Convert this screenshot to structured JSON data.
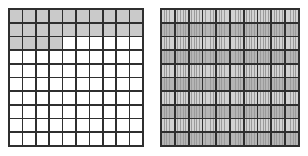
{
  "figure": {
    "background_color": "#ffffff",
    "line_color": "#2b2b2b",
    "shaded_color": "#c9c9c9",
    "strip_color": "#d2d2d2"
  },
  "grids": [
    {
      "name": "hundredths-grid",
      "label": "",
      "rows": 10,
      "columns": 10,
      "total_cells": 100,
      "shaded_cells": 24,
      "fraction_shaded": "24/100",
      "shading_by_row": [
        10,
        10,
        4,
        0,
        0,
        0,
        0,
        0,
        0,
        0
      ],
      "shaded_color": "#c9c9c9",
      "unshaded_color": "#ffffff"
    },
    {
      "name": "thousandths-grid",
      "label": "",
      "rows": 10,
      "columns": 10,
      "total_cells": 100,
      "strips_per_cell": 5,
      "total_strips": 500,
      "shaded_cells": 100,
      "fraction_shaded": "100/100",
      "shading_by_row": [
        10,
        10,
        10,
        10,
        10,
        10,
        10,
        10,
        10,
        10
      ],
      "strip_color": "#d2d2d2"
    }
  ]
}
